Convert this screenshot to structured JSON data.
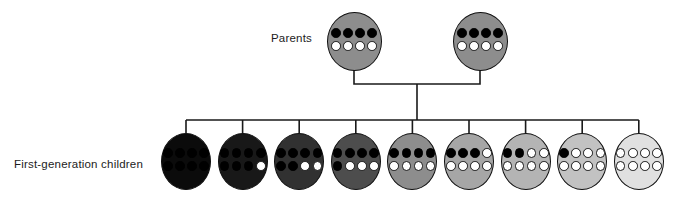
{
  "labels": {
    "parents": "Parents",
    "children": "First-generation children"
  },
  "parents": [
    {
      "name": "parent-1",
      "fill": "#8d8d8d",
      "dark_alleles": 4,
      "light_alleles": 4,
      "top": [
        "B",
        "B",
        "B",
        "B"
      ],
      "bottom": [
        "W",
        "W",
        "W",
        "W"
      ]
    },
    {
      "name": "parent-2",
      "fill": "#8d8d8d",
      "dark_alleles": 4,
      "light_alleles": 4,
      "top": [
        "B",
        "B",
        "B",
        "B"
      ],
      "bottom": [
        "W",
        "W",
        "W",
        "W"
      ]
    }
  ],
  "children": [
    {
      "name": "child-1",
      "fill": "#0b0b0b",
      "dark_alleles": 8,
      "light_alleles": 0,
      "top": [
        "B",
        "B",
        "B",
        "B"
      ],
      "bottom": [
        "B",
        "B",
        "B",
        "B"
      ]
    },
    {
      "name": "child-2",
      "fill": "#181818",
      "dark_alleles": 7,
      "light_alleles": 1,
      "top": [
        "B",
        "B",
        "B",
        "B"
      ],
      "bottom": [
        "B",
        "B",
        "B",
        "W"
      ]
    },
    {
      "name": "child-3",
      "fill": "#313131",
      "dark_alleles": 6,
      "light_alleles": 2,
      "top": [
        "B",
        "B",
        "B",
        "B"
      ],
      "bottom": [
        "B",
        "B",
        "W",
        "W"
      ]
    },
    {
      "name": "child-4",
      "fill": "#4d4d4d",
      "dark_alleles": 5,
      "light_alleles": 3,
      "top": [
        "B",
        "B",
        "B",
        "B"
      ],
      "bottom": [
        "B",
        "W",
        "W",
        "W"
      ]
    },
    {
      "name": "child-5",
      "fill": "#8d8d8d",
      "dark_alleles": 4,
      "light_alleles": 4,
      "top": [
        "B",
        "B",
        "B",
        "B"
      ],
      "bottom": [
        "W",
        "W",
        "W",
        "W"
      ]
    },
    {
      "name": "child-6",
      "fill": "#a6a6a6",
      "dark_alleles": 3,
      "light_alleles": 5,
      "top": [
        "B",
        "B",
        "B",
        "W"
      ],
      "bottom": [
        "W",
        "W",
        "W",
        "W"
      ]
    },
    {
      "name": "child-7",
      "fill": "#b4b4b4",
      "dark_alleles": 2,
      "light_alleles": 6,
      "top": [
        "B",
        "B",
        "W",
        "W"
      ],
      "bottom": [
        "W",
        "W",
        "W",
        "W"
      ]
    },
    {
      "name": "child-8",
      "fill": "#c2c2c2",
      "dark_alleles": 1,
      "light_alleles": 7,
      "top": [
        "B",
        "W",
        "W",
        "W"
      ],
      "bottom": [
        "W",
        "W",
        "W",
        "W"
      ]
    },
    {
      "name": "child-9",
      "fill": "#e0e0e0",
      "dark_alleles": 0,
      "light_alleles": 8,
      "top": [
        "W",
        "W",
        "W",
        "W"
      ],
      "bottom": [
        "W",
        "W",
        "W",
        "W"
      ]
    }
  ],
  "colors": {
    "line": "#1a1a1a",
    "dot_dark": "#000000",
    "dot_light": "#ffffff",
    "dot_outline": "#161616",
    "background": "#ffffff",
    "parent_fill": "#8d8d8d"
  }
}
